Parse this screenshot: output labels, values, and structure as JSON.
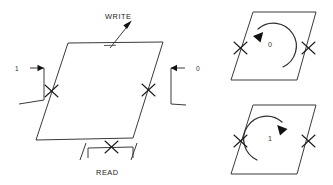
{
  "figure": {
    "background_color": "#ffffff",
    "line_color": "#3a3a3a",
    "label_color": "#222222",
    "width": 333,
    "height": 185
  },
  "main_core": {
    "name": "main-core-parallelogram",
    "write_label": "WRITE",
    "read_label": "READ",
    "input_left_label": "1",
    "input_right_label": "0",
    "corners": {
      "top_left": [
        68,
        43
      ],
      "top_right": [
        163,
        42
      ],
      "bottom_right": [
        133,
        138
      ],
      "bottom_left": [
        36,
        140
      ]
    },
    "crossings": [
      {
        "name": "left-wire-crossing",
        "x": 51,
        "y": 91
      },
      {
        "name": "right-wire-crossing",
        "x": 148,
        "y": 90
      },
      {
        "name": "read-wire-crossing",
        "x": 111,
        "y": 148
      }
    ]
  },
  "state_cores": [
    {
      "name": "state-core-zero",
      "state_label": "0",
      "rotation": "counterclockwise",
      "corners": {
        "top_left": [
          253,
          12
        ],
        "top_right": [
          316,
          12
        ],
        "bottom_right": [
          297,
          80
        ],
        "bottom_left": [
          231,
          80
        ]
      },
      "crossings": [
        {
          "name": "left-crossing",
          "x": 240,
          "y": 48
        },
        {
          "name": "right-crossing",
          "x": 308,
          "y": 48
        }
      ]
    },
    {
      "name": "state-core-one",
      "state_label": "1",
      "rotation": "clockwise",
      "corners": {
        "top_left": [
          253,
          105
        ],
        "top_right": [
          316,
          105
        ],
        "bottom_right": [
          297,
          174
        ],
        "bottom_left": [
          231,
          174
        ]
      },
      "crossings": [
        {
          "name": "left-crossing",
          "x": 240,
          "y": 141
        },
        {
          "name": "right-crossing",
          "x": 308,
          "y": 141
        }
      ]
    }
  ]
}
